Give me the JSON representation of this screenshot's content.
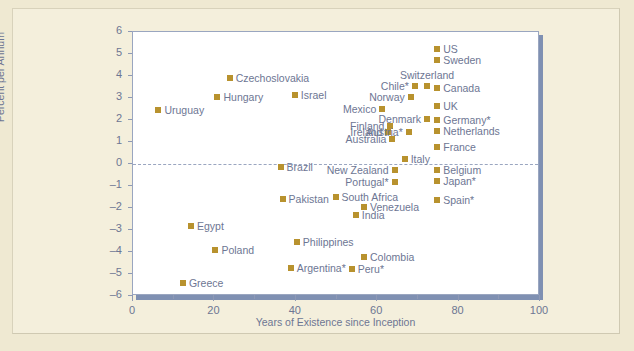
{
  "chart_data": {
    "type": "scatter",
    "title": "",
    "xlabel": "Years of Existence since Inception",
    "ylabel": "Percent per Annum",
    "xlim": [
      0,
      100
    ],
    "ylim": [
      -6,
      6
    ],
    "xticks": [
      "0",
      "20",
      "40",
      "60",
      "80",
      "100"
    ],
    "yticks": [
      "6",
      "5",
      "4",
      "3",
      "2",
      "1",
      "0",
      "-1",
      "-2",
      "-3",
      "-4",
      "-5",
      "-6"
    ],
    "grid": false,
    "zero_reference_line": true,
    "legend": "none",
    "marker_color": "#b8922e",
    "text_color": "#6d7693",
    "points": [
      {
        "label": "Uruguay",
        "x": 6.5,
        "y": 2.4,
        "pos": "right"
      },
      {
        "label": "Hungary",
        "x": 21.0,
        "y": 3.0,
        "pos": "right"
      },
      {
        "label": "Czechoslovakia",
        "x": 24.0,
        "y": 3.85,
        "pos": "right"
      },
      {
        "label": "Israel",
        "x": 40.0,
        "y": 3.1,
        "pos": "right"
      },
      {
        "label": "US",
        "x": 75.0,
        "y": 5.2,
        "pos": "right"
      },
      {
        "label": "Sweden",
        "x": 75.0,
        "y": 4.7,
        "pos": "right"
      },
      {
        "label": "Switzerland",
        "x": 72.5,
        "y": 3.5,
        "pos": "above"
      },
      {
        "label": "Canada",
        "x": 75.0,
        "y": 3.4,
        "pos": "right"
      },
      {
        "label": "Chile*",
        "x": 69.5,
        "y": 3.5,
        "pos": "left"
      },
      {
        "label": "Norway",
        "x": 68.5,
        "y": 3.0,
        "pos": "left"
      },
      {
        "label": "Mexico",
        "x": 61.5,
        "y": 2.45,
        "pos": "left"
      },
      {
        "label": "UK",
        "x": 75.0,
        "y": 2.6,
        "pos": "right"
      },
      {
        "label": "Denmark",
        "x": 72.5,
        "y": 2.0,
        "pos": "left"
      },
      {
        "label": "Finland",
        "x": 63.5,
        "y": 1.7,
        "pos": "left"
      },
      {
        "label": "Germany*",
        "x": 75.0,
        "y": 1.95,
        "pos": "right"
      },
      {
        "label": "Ireland",
        "x": 63.0,
        "y": 1.4,
        "pos": "left"
      },
      {
        "label": "Netherlands",
        "x": 75.0,
        "y": 1.45,
        "pos": "right"
      },
      {
        "label": "Austria*",
        "x": 68.0,
        "y": 1.4,
        "pos": "left"
      },
      {
        "label": "Australia",
        "x": 64.0,
        "y": 1.1,
        "pos": "left"
      },
      {
        "label": "France",
        "x": 75.0,
        "y": 0.75,
        "pos": "right"
      },
      {
        "label": "Italy",
        "x": 67.0,
        "y": 0.2,
        "pos": "right"
      },
      {
        "label": "Brazil",
        "x": 36.5,
        "y": -0.2,
        "pos": "right"
      },
      {
        "label": "New Zealand",
        "x": 64.5,
        "y": -0.3,
        "pos": "left"
      },
      {
        "label": "Belgium",
        "x": 75.0,
        "y": -0.3,
        "pos": "right"
      },
      {
        "label": "Portugal*",
        "x": 64.5,
        "y": -0.85,
        "pos": "left"
      },
      {
        "label": "Japan*",
        "x": 75.0,
        "y": -0.8,
        "pos": "right"
      },
      {
        "label": "Pakistan",
        "x": 37.0,
        "y": -1.65,
        "pos": "right"
      },
      {
        "label": "South Africa",
        "x": 50.0,
        "y": -1.55,
        "pos": "right"
      },
      {
        "label": "Spain*",
        "x": 75.0,
        "y": -1.7,
        "pos": "right"
      },
      {
        "label": "Venezuela",
        "x": 57.0,
        "y": -2.0,
        "pos": "right"
      },
      {
        "label": "India",
        "x": 55.0,
        "y": -2.35,
        "pos": "right"
      },
      {
        "label": "Egypt",
        "x": 14.5,
        "y": -2.85,
        "pos": "right"
      },
      {
        "label": "Philippines",
        "x": 40.5,
        "y": -3.6,
        "pos": "right"
      },
      {
        "label": "Poland",
        "x": 20.5,
        "y": -3.95,
        "pos": "right"
      },
      {
        "label": "Colombia",
        "x": 57.0,
        "y": -4.25,
        "pos": "right"
      },
      {
        "label": "Argentina*",
        "x": 39.0,
        "y": -4.75,
        "pos": "right"
      },
      {
        "label": "Peru*",
        "x": 54.0,
        "y": -4.8,
        "pos": "right"
      },
      {
        "label": "Greece",
        "x": 12.5,
        "y": -5.45,
        "pos": "right"
      }
    ]
  }
}
